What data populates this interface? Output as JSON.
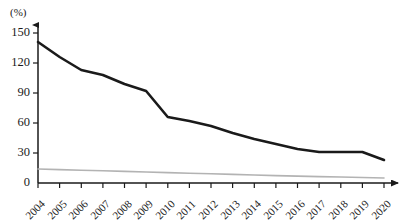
{
  "chart_data": {
    "type": "line",
    "title": "",
    "subtitle": "",
    "xlabel": "",
    "ylabel": "",
    "y_unit_label": "(%)",
    "categories": [
      "2004",
      "2005",
      "2006",
      "2007",
      "2008",
      "2009",
      "2010",
      "2011",
      "2012",
      "2013",
      "2014",
      "2015",
      "2016",
      "2017",
      "2018",
      "2019",
      "2020"
    ],
    "x": [
      2004,
      2005,
      2006,
      2007,
      2008,
      2009,
      2010,
      2011,
      2012,
      2013,
      2014,
      2015,
      2016,
      2017,
      2018,
      2019,
      2020
    ],
    "ylim": [
      0,
      158
    ],
    "xlim": [
      2004,
      2020
    ],
    "yticks": [
      0,
      30,
      60,
      90,
      120,
      150
    ],
    "ytick_labels": [
      "0",
      "30",
      "60",
      "90",
      "120",
      "150"
    ],
    "grid": false,
    "legend": false,
    "legend_position": "none",
    "series": [
      {
        "name": "series-black",
        "color": "#1a1a1a",
        "width": 2.6,
        "values": [
          141,
          126,
          113,
          108,
          99,
          92,
          66,
          62,
          57,
          50,
          44,
          39,
          34,
          31,
          31,
          31,
          23
        ]
      },
      {
        "name": "series-gray",
        "color": "#b3b3b3",
        "width": 1.6,
        "values": [
          14,
          13.4,
          12.8,
          12.2,
          11.6,
          11,
          10.4,
          9.8,
          9.2,
          8.6,
          8,
          7.4,
          6.9,
          6.4,
          6,
          5.5,
          5
        ]
      }
    ]
  },
  "axes": {
    "y_unit": "(%)",
    "y_tick_labels": [
      "150",
      "120",
      "90",
      "60",
      "30",
      "0"
    ],
    "x_tick_labels": [
      "2004",
      "2005",
      "2006",
      "2007",
      "2008",
      "2009",
      "2010",
      "2011",
      "2012",
      "2013",
      "2014",
      "2015",
      "2016",
      "2017",
      "2018",
      "2019",
      "2020"
    ]
  }
}
